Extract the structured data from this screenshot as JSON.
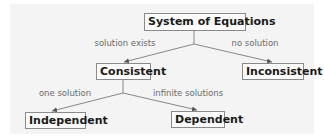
{
  "diagram": {
    "type": "tree",
    "background_color": "#f4f4f4",
    "line_color": "#888888",
    "nodes": [
      {
        "id": "root",
        "label": "System of Equations"
      },
      {
        "id": "consistent",
        "label": "Consistent"
      },
      {
        "id": "inconsistent",
        "label": "Inconsistent"
      },
      {
        "id": "independent",
        "label": "Independent"
      },
      {
        "id": "dependent",
        "label": "Dependent"
      }
    ],
    "edges": [
      {
        "from": "root",
        "to": "consistent",
        "label": "solution exists"
      },
      {
        "from": "root",
        "to": "inconsistent",
        "label": "no solution"
      },
      {
        "from": "consistent",
        "to": "independent",
        "label": "one solution"
      },
      {
        "from": "consistent",
        "to": "dependent",
        "label": "infinite solutions"
      }
    ]
  }
}
